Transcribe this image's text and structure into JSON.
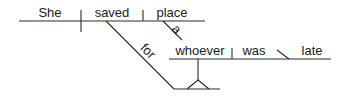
{
  "diagram": {
    "type": "sentence-diagram",
    "sentence": "She saved a place for whoever was late",
    "words": {
      "subject": "She",
      "verb": "saved",
      "object": "place",
      "object_modifier": "a",
      "preposition": "for",
      "clause_subject": "whoever",
      "clause_verb": "was",
      "predicate_adjective": "late"
    }
  }
}
